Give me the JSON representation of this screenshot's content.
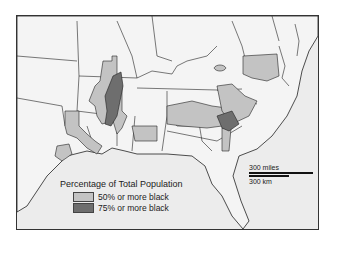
{
  "map": {
    "title": "Percentage of Total Population",
    "region": "Southeastern United States",
    "colors": {
      "water": "#ececec",
      "land": "#f4f4f4",
      "light": "#c3c3c3",
      "dark": "#6e6e6e",
      "border": "#222222"
    }
  },
  "legend": {
    "title": "Percentage of Total Population",
    "items": [
      {
        "label": "50% or more black",
        "color": "#c3c3c3"
      },
      {
        "label": "75% or more black",
        "color": "#6e6e6e"
      }
    ]
  },
  "scale": {
    "miles_label": "300 miles",
    "km_label": "300 km"
  }
}
